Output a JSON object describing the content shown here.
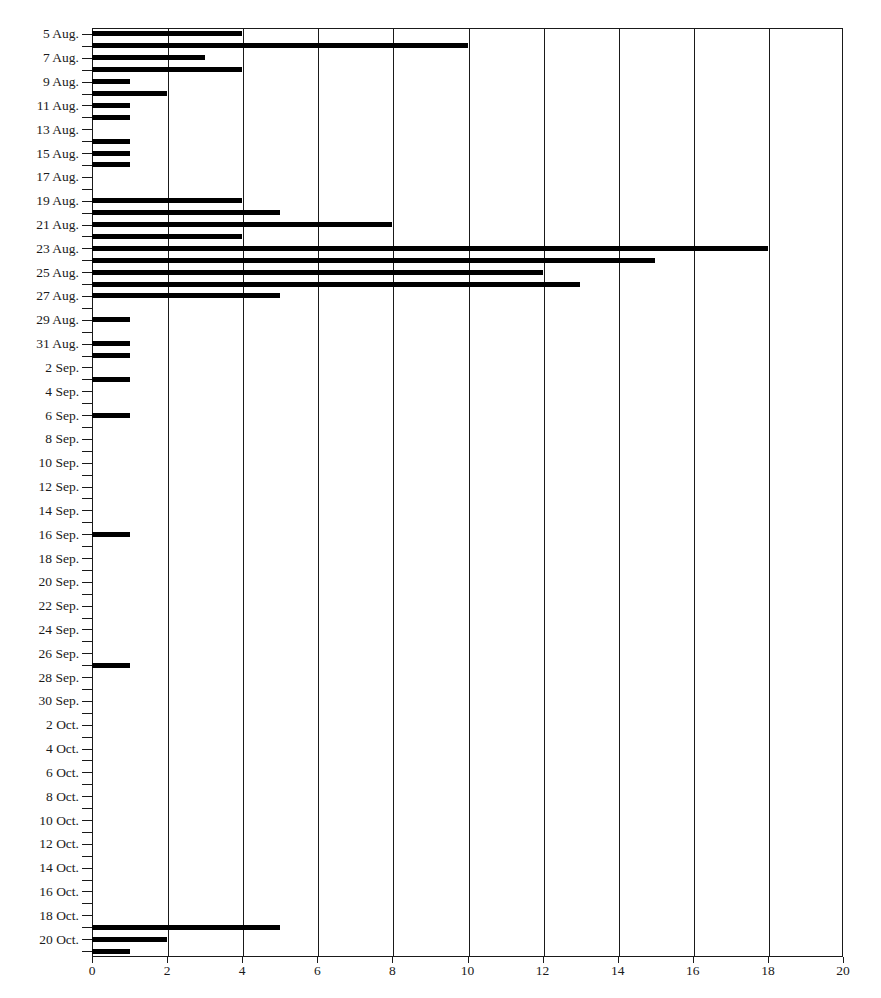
{
  "chart_data": {
    "type": "bar",
    "orientation": "horizontal",
    "title": "",
    "subtitle": "",
    "xlabel": "",
    "ylabel": "",
    "xlim": [
      0,
      20
    ],
    "ylim_categories_count": 78,
    "x_ticks": [
      0,
      2,
      4,
      6,
      8,
      10,
      12,
      14,
      16,
      18,
      20
    ],
    "x_tick_labels": [
      "0",
      "2",
      "4",
      "6",
      "8",
      "10",
      "12",
      "14",
      "16",
      "18",
      "20"
    ],
    "x_tick_step": 2,
    "grid": "vertical",
    "legend": "none",
    "bar_color": "#000000",
    "axis_color": "#1a1a1a",
    "background_color": "#ffffff",
    "y_axis_labels_shown": [
      "5 Aug.",
      "7 Aug.",
      "9 Aug.",
      "11 Aug.",
      "13 Aug.",
      "15 Aug.",
      "17 Aug.",
      "19 Aug.",
      "21 Aug.",
      "23 Aug.",
      "25 Aug.",
      "27 Aug.",
      "29 Aug.",
      "31 Aug.",
      "2 Sep.",
      "4 Sep.",
      "6 Sep.",
      "8 Sep.",
      "10 Sep.",
      "12 Sep.",
      "14 Sep.",
      "16 Sep.",
      "18 Sep.",
      "20 Sep.",
      "22 Sep.",
      "24 Sep.",
      "26 Sep.",
      "28 Sep.",
      "30 Sep.",
      "2 Oct.",
      "4 Oct.",
      "6 Oct.",
      "8 Oct.",
      "10 Oct.",
      "12 Oct.",
      "14 Oct.",
      "16 Oct.",
      "18 Oct.",
      "20 Oct."
    ],
    "categories": [
      "5 Aug.",
      "6 Aug.",
      "7 Aug.",
      "8 Aug.",
      "9 Aug.",
      "10 Aug.",
      "11 Aug.",
      "12 Aug.",
      "13 Aug.",
      "14 Aug.",
      "15 Aug.",
      "16 Aug.",
      "17 Aug.",
      "18 Aug.",
      "19 Aug.",
      "20 Aug.",
      "21 Aug.",
      "22 Aug.",
      "23 Aug.",
      "24 Aug.",
      "25 Aug.",
      "26 Aug.",
      "27 Aug.",
      "28 Aug.",
      "29 Aug.",
      "30 Aug.",
      "31 Aug.",
      "1 Sep.",
      "2 Sep.",
      "3 Sep.",
      "4 Sep.",
      "5 Sep.",
      "6 Sep.",
      "7 Sep.",
      "8 Sep.",
      "9 Sep.",
      "10 Sep.",
      "11 Sep.",
      "12 Sep.",
      "13 Sep.",
      "14 Sep.",
      "15 Sep.",
      "16 Sep.",
      "17 Sep.",
      "18 Sep.",
      "19 Sep.",
      "20 Sep.",
      "21 Sep.",
      "22 Sep.",
      "23 Sep.",
      "24 Sep.",
      "25 Sep.",
      "26 Sep.",
      "27 Sep.",
      "28 Sep.",
      "29 Sep.",
      "30 Sep.",
      "1 Oct.",
      "2 Oct.",
      "3 Oct.",
      "4 Oct.",
      "5 Oct.",
      "6 Oct.",
      "7 Oct.",
      "8 Oct.",
      "9 Oct.",
      "10 Oct.",
      "11 Oct.",
      "12 Oct.",
      "13 Oct.",
      "14 Oct.",
      "15 Oct.",
      "16 Oct.",
      "17 Oct.",
      "18 Oct.",
      "19 Oct.",
      "20 Oct.",
      "21 Oct."
    ],
    "values": [
      4,
      10,
      3,
      4,
      1,
      2,
      1,
      1,
      0,
      1,
      1,
      1,
      0,
      0,
      4,
      5,
      8,
      4,
      18,
      15,
      12,
      13,
      5,
      0,
      1,
      0,
      1,
      1,
      0,
      1,
      0,
      0,
      1,
      0,
      0,
      0,
      0,
      0,
      0,
      0,
      0,
      0,
      1,
      0,
      0,
      0,
      0,
      0,
      0,
      0,
      0,
      0,
      0,
      1,
      0,
      0,
      0,
      0,
      0,
      0,
      0,
      0,
      0,
      0,
      0,
      0,
      0,
      0,
      0,
      0,
      0,
      0,
      0,
      0,
      0,
      5,
      2,
      1
    ]
  }
}
